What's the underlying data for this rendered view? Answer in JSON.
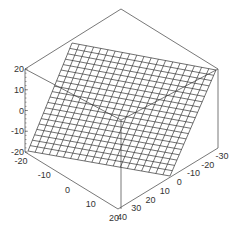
{
  "chart_data": {
    "type": "surface3d",
    "title": "",
    "surface": {
      "description": "Planar wireframe surface z = a*x + b*y",
      "grid_lines_u": 20,
      "grid_lines_v": 20,
      "corners": [
        {
          "x": -20,
          "y": -30,
          "z": 20
        },
        {
          "x": -20,
          "y": 40,
          "z": -20
        },
        {
          "x": 20,
          "y": 40,
          "z": -20
        },
        {
          "x": 20,
          "y": -30,
          "z": 20
        }
      ]
    },
    "axes": {
      "z": {
        "label": "",
        "ticks": [
          "20",
          "10",
          "0",
          "-10",
          "-20"
        ],
        "range": [
          -20,
          20
        ]
      },
      "x": {
        "label": "",
        "ticks": [
          "-20",
          "-10",
          "0",
          "10",
          "20"
        ],
        "range": [
          -20,
          20
        ]
      },
      "y": {
        "label": "",
        "ticks": [
          "40",
          "30",
          "20",
          "10",
          "0",
          "-10",
          "-20",
          "-30"
        ],
        "range": [
          -30,
          40
        ]
      }
    },
    "box": true,
    "grid": false,
    "legend": "none",
    "colors": {
      "mesh": "#333333",
      "box": "#555555",
      "text": "#333333"
    }
  }
}
